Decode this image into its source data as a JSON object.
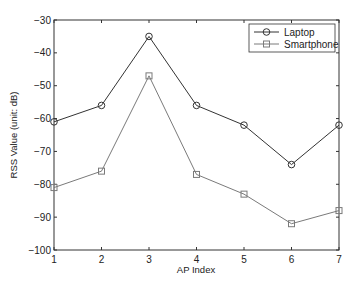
{
  "chart_data": {
    "type": "line",
    "title": "",
    "xlabel": "AP Index",
    "ylabel": "RSS Value (unit: dB)",
    "x": [
      1,
      2,
      3,
      4,
      5,
      6,
      7
    ],
    "xticks": [
      "1",
      "2",
      "3",
      "4",
      "5",
      "6",
      "7"
    ],
    "yticks": [
      "-30",
      "-40",
      "-50",
      "-60",
      "-70",
      "-80",
      "-90",
      "-100"
    ],
    "xlim": [
      1,
      7
    ],
    "ylim": [
      -100,
      -30
    ],
    "grid": false,
    "legend_position": "upper right",
    "series": [
      {
        "name": "Laptop",
        "marker": "circle",
        "color": "#333333",
        "values": [
          -61,
          -56,
          -35,
          -56,
          -62,
          -74,
          -62
        ]
      },
      {
        "name": "Smartphone",
        "marker": "square",
        "color": "#7a7a7a",
        "values": [
          -81,
          -76,
          -47,
          -77,
          -83,
          -92,
          -88
        ]
      }
    ]
  }
}
